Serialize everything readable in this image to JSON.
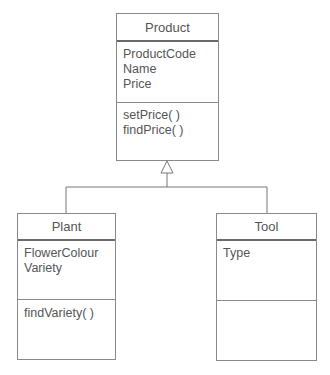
{
  "diagram": {
    "type": "UML class diagram",
    "classes": [
      {
        "name": "Product",
        "attributes": [
          "ProductCode",
          "Name",
          "Price"
        ],
        "methods": [
          "setPrice( )",
          "findPrice( )"
        ]
      },
      {
        "name": "Plant",
        "attributes": [
          "FlowerColour",
          "Variety"
        ],
        "methods": [
          "findVariety( )"
        ]
      },
      {
        "name": "Tool",
        "attributes": [
          "Type"
        ],
        "methods": []
      }
    ],
    "relationships": [
      {
        "type": "generalization",
        "from": "Plant",
        "to": "Product"
      },
      {
        "type": "generalization",
        "from": "Tool",
        "to": "Product"
      }
    ]
  }
}
